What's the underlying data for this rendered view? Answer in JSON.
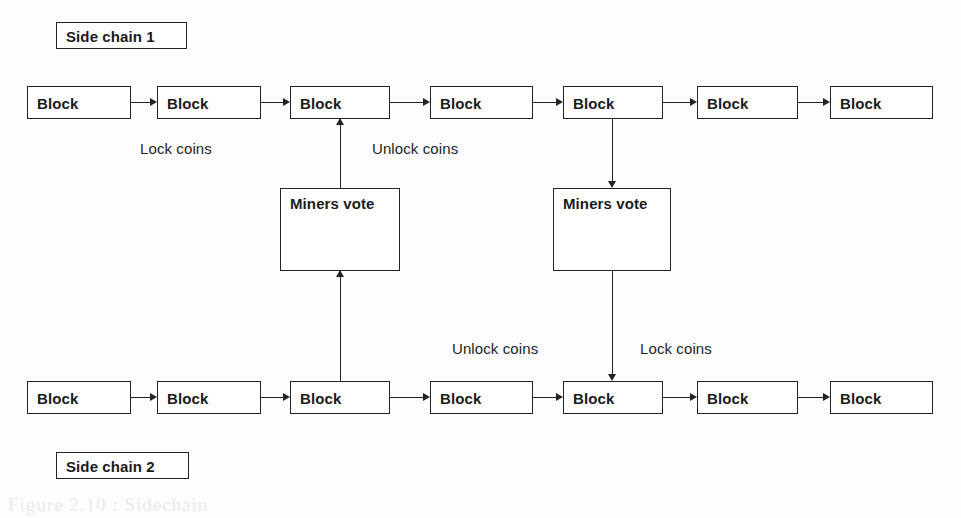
{
  "figure": {
    "kind": "blockchain-sidechain-two-way-peg-diagram",
    "background_color": "#fdfdfd",
    "stroke_color": "#232323",
    "text_color": "#1a1a1a"
  },
  "chain_tags": [
    {
      "id": "side-chain-1",
      "label": "Side chain 1",
      "x": 56,
      "y": 22,
      "width": 131
    },
    {
      "id": "side-chain-2",
      "label": "Side chain 2",
      "x": 56,
      "y": 452,
      "width": 133
    }
  ],
  "chains": [
    {
      "id": "top-chain",
      "belongs_to": "Side chain 1",
      "y": 86,
      "blocks": [
        {
          "index": 1,
          "label": "Block",
          "x": 27,
          "width": 104
        },
        {
          "index": 2,
          "label": "Block",
          "x": 157,
          "width": 104
        },
        {
          "index": 3,
          "label": "Block",
          "x": 290,
          "width": 100
        },
        {
          "index": 4,
          "label": "Block",
          "x": 430,
          "width": 103
        },
        {
          "index": 5,
          "label": "Block",
          "x": 563,
          "width": 100
        },
        {
          "index": 6,
          "label": "Block",
          "x": 697,
          "width": 101
        },
        {
          "index": 7,
          "label": "Block",
          "x": 830,
          "width": 103
        }
      ]
    },
    {
      "id": "bottom-chain",
      "belongs_to": "Side chain 2",
      "y": 381,
      "blocks": [
        {
          "index": 1,
          "label": "Block",
          "x": 27,
          "width": 104
        },
        {
          "index": 2,
          "label": "Block",
          "x": 157,
          "width": 104
        },
        {
          "index": 3,
          "label": "Block",
          "x": 290,
          "width": 100
        },
        {
          "index": 4,
          "label": "Block",
          "x": 430,
          "width": 103
        },
        {
          "index": 5,
          "label": "Block",
          "x": 563,
          "width": 100
        },
        {
          "index": 6,
          "label": "Block",
          "x": 697,
          "width": 101
        },
        {
          "index": 7,
          "label": "Block",
          "x": 830,
          "width": 103
        }
      ]
    }
  ],
  "vote_boxes": [
    {
      "id": "miners-vote-left",
      "label": "Miners vote",
      "x": 280,
      "y": 188,
      "width": 120,
      "incoming": "bottom-chain block 3 (arrow up)",
      "outgoing": "top-chain block 3 (arrow up)"
    },
    {
      "id": "miners-vote-right",
      "label": "Miners vote",
      "x": 553,
      "y": 188,
      "width": 118,
      "incoming": "top-chain block 5 (arrow down)",
      "outgoing": "bottom-chain block 5 (arrow down)"
    }
  ],
  "edge_labels": [
    {
      "id": "lock-coins-top",
      "label": "Lock coins",
      "x": 140,
      "y": 140
    },
    {
      "id": "unlock-coins-top",
      "label": "Unlock coins",
      "x": 372,
      "y": 140
    },
    {
      "id": "unlock-coins-bottom",
      "label": "Unlock coins",
      "x": 452,
      "y": 340
    },
    {
      "id": "lock-coins-bottom",
      "label": "Lock coins",
      "x": 640,
      "y": 340
    }
  ],
  "ghost_text": [
    {
      "label": "Figure 2.10 : Sidechain",
      "x": 8,
      "y": 494
    }
  ]
}
